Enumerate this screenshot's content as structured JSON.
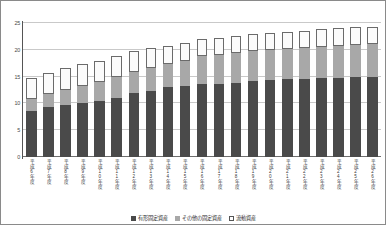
{
  "chart_data": {
    "type": "bar",
    "stacked": true,
    "title": "",
    "subtitle": "",
    "xlabel": "",
    "ylabel": "",
    "ylim": [
      0,
      25
    ],
    "yticks": [
      0,
      5,
      10,
      15,
      20,
      25
    ],
    "ytick_labels": [
      "0",
      "5",
      "10",
      "15",
      "20",
      "25"
    ],
    "grid": true,
    "legend_position": "bottom",
    "categories": [
      "平成6年度",
      "平成7年度",
      "平成8年度",
      "平成9年度",
      "平成10年度",
      "平成11年度",
      "平成12年度",
      "平成13年度",
      "平成14年度",
      "平成15年度",
      "平成16年度",
      "平成17年度",
      "平成18年度",
      "平成19年度",
      "平成20年度",
      "平成21年度",
      "平成22年度",
      "平成23年度",
      "平成24年度",
      "平成25年度",
      "平成26年度"
    ],
    "series": [
      {
        "name": "有形固定資産",
        "color": "#4a4a4a",
        "values": [
          8.6,
          9.3,
          9.7,
          10.1,
          10.4,
          11.0,
          11.9,
          12.4,
          13.0,
          13.2,
          13.6,
          13.7,
          13.9,
          14.2,
          14.3,
          14.5,
          14.6,
          14.7,
          14.8,
          14.9,
          15.0
        ]
      },
      {
        "name": "その他の固定資産",
        "color": "#a8a8a8",
        "values": [
          2.3,
          2.5,
          2.8,
          3.1,
          3.6,
          3.9,
          3.9,
          4.2,
          4.3,
          4.8,
          5.2,
          5.4,
          5.5,
          5.5,
          5.6,
          5.7,
          5.8,
          5.9,
          6.0,
          6.0,
          6.0
        ]
      },
      {
        "name": "流動資産",
        "color": "#ffffff",
        "values": [
          3.9,
          3.8,
          4.1,
          4.1,
          4.0,
          3.9,
          3.9,
          3.8,
          3.4,
          3.3,
          3.2,
          3.2,
          3.2,
          3.2,
          3.2,
          3.2,
          3.2,
          3.2,
          3.3,
          3.3,
          3.3
        ]
      }
    ],
    "totals": [
      14.8,
      15.6,
      16.6,
      17.3,
      18.0,
      18.8,
      19.7,
      20.4,
      20.7,
      21.3,
      22.0,
      22.3,
      22.6,
      22.9,
      23.1,
      23.4,
      23.6,
      23.8,
      24.1,
      24.2,
      24.3
    ]
  },
  "legend": {
    "items": [
      {
        "label": "有形固定資産",
        "swatch": "tangible"
      },
      {
        "label": "その他の固定資産",
        "swatch": "other"
      },
      {
        "label": "流動資産",
        "swatch": "current"
      }
    ]
  }
}
